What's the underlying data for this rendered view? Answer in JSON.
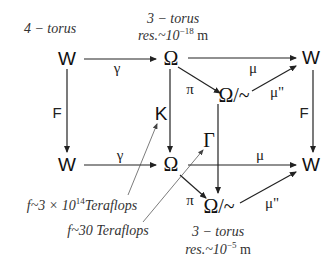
{
  "nodes": {
    "w_top_left": "W",
    "omega_top": "Ω",
    "w_top_right": "W",
    "omega_quot_top": "Ω/~",
    "k": "K",
    "w_bottom_left": "W",
    "omega_bottom": "Ω",
    "gamma_cap": "Γ",
    "w_bottom_right": "W",
    "omega_quot_bottom": "Ω/~"
  },
  "arrow_labels": {
    "gamma_top": "γ",
    "mu_top": "μ",
    "pi_top": "π",
    "mu_sharp_top": "μ\"",
    "f_left": "F",
    "f_right": "F",
    "gamma_bottom": "γ",
    "mu_bottom": "μ",
    "pi_bottom": "π",
    "mu_sharp_bottom": "μ\""
  },
  "annotations": {
    "four_torus": "4 − torus",
    "three_torus_top": "3 − torus",
    "res_top_prefix": "res.~10",
    "res_top_exp": "−18",
    "res_top_unit": " m",
    "teraflops_k_prefix": "f~3 × 10",
    "teraflops_k_exp": "14",
    "teraflops_k_suffix": "Teraflops",
    "teraflops_gamma": "f~30 Teraflops",
    "three_torus_bottom": "3 − torus",
    "res_bottom_prefix": "res.~10",
    "res_bottom_exp": "−5",
    "res_bottom_unit": " m"
  },
  "colors": {
    "stroke": "#222222",
    "thin_stroke": "#444444",
    "background": "#ffffff"
  }
}
